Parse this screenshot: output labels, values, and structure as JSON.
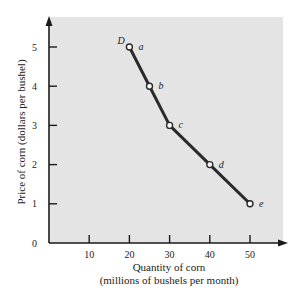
{
  "chart_data": {
    "type": "line",
    "title": "",
    "curve_label": "D",
    "xlabel": "Quantity of corn",
    "xlabel_sub": "(millions of bushels per month)",
    "ylabel": "Price of corn (dollars per bushel)",
    "xlim": [
      0,
      58
    ],
    "ylim": [
      0,
      5.7
    ],
    "x_ticks": [
      10,
      20,
      30,
      40,
      50
    ],
    "y_ticks": [
      0,
      1,
      2,
      3,
      4,
      5
    ],
    "grid": false,
    "series": [
      {
        "name": "D",
        "points": [
          {
            "label": "a",
            "x": 20,
            "y": 5
          },
          {
            "label": "b",
            "x": 25,
            "y": 4
          },
          {
            "label": "c",
            "x": 30,
            "y": 3
          },
          {
            "label": "d",
            "x": 40,
            "y": 2
          },
          {
            "label": "e",
            "x": 50,
            "y": 1
          }
        ]
      }
    ],
    "colors": {
      "panel": "#e4e4e4",
      "line": "#2a2a2a",
      "axis": "#1a1a1a"
    }
  }
}
